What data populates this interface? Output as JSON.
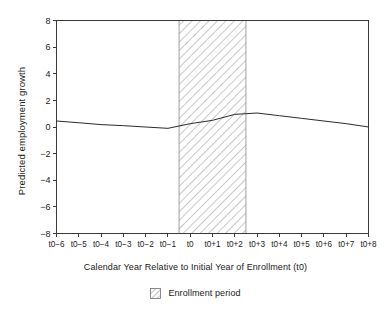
{
  "chart_data": {
    "type": "line",
    "title": "",
    "xlabel": "Calendar Year Relative to Initial Year of Enrollment (t0)",
    "ylabel": "Predicted employment growth",
    "categories": [
      "t0−6",
      "t0−5",
      "t0−4",
      "t0−3",
      "t0−2",
      "t0−1",
      "t0",
      "t0+1",
      "t0+2",
      "t0+3",
      "t0+4",
      "t0+5",
      "t0+6",
      "t0+7",
      "t0+8"
    ],
    "x_indices": [
      0,
      1,
      2,
      3,
      4,
      5,
      6,
      7,
      8,
      9,
      10,
      11,
      12,
      13,
      14
    ],
    "series": [
      {
        "name": "Predicted employment growth",
        "values": [
          0.45,
          0.32,
          0.18,
          0.1,
          0.0,
          -0.1,
          0.25,
          0.5,
          0.95,
          1.05,
          0.85,
          0.65,
          0.45,
          0.25,
          0.0
        ],
        "color": "#2b2b2b"
      }
    ],
    "ylim": [
      -8,
      8
    ],
    "yticks": [
      8,
      6,
      4,
      2,
      0,
      -2,
      -4,
      -6,
      -8
    ],
    "ytick_labels": [
      "8",
      "6",
      "4",
      "2",
      "0",
      "−2",
      "−4",
      "−6",
      "−8"
    ],
    "grid": false,
    "legend_position": "bottom",
    "shaded_band": {
      "label": "Enrollment period",
      "start_index": 5.5,
      "end_index": 8.5,
      "pattern": "diagonal-hatch",
      "hatch_color": "#9a9a9a",
      "border_color": "#8a8a8a"
    }
  },
  "legend": {
    "items": [
      {
        "label": "Enrollment period",
        "swatch": "hatch-swatch"
      }
    ]
  },
  "axes": {
    "frame_color": "#3a3a3a",
    "background": "#ffffff"
  }
}
